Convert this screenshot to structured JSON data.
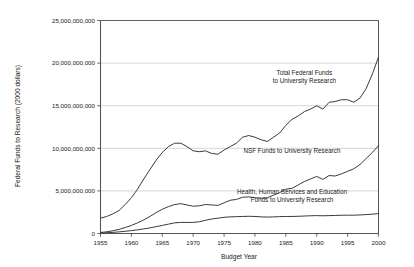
{
  "chart_data": {
    "type": "line",
    "title": "",
    "xlabel": "Budget Year",
    "ylabel": "Federal Funds to Research (2000 dollars)",
    "xlim": [
      1955,
      2000
    ],
    "ylim": [
      0,
      25000000000
    ],
    "grid": true,
    "grid_axis": "y",
    "legend_position": "inline-annotations",
    "xticks": [
      1955,
      1960,
      1965,
      1970,
      1975,
      1980,
      1985,
      1990,
      1995,
      2000
    ],
    "xtick_labels": [
      "1955",
      "1960",
      "1965",
      "1970",
      "1975",
      "1980",
      "1985",
      "1990",
      "1995",
      "2000"
    ],
    "yticks": [
      0,
      5000000000,
      10000000000,
      15000000000,
      20000000000,
      25000000000
    ],
    "ytick_labels": [
      "0",
      "5,000,000,000",
      "10,000,000,000",
      "15,000,000,000",
      "20,000,000,000",
      "25,000,000,000"
    ],
    "line_color": "#3a3a3a",
    "grid_color": "#cccccc",
    "axis_color": "#555555",
    "x": [
      1955,
      1956,
      1957,
      1958,
      1959,
      1960,
      1961,
      1962,
      1963,
      1964,
      1965,
      1966,
      1967,
      1968,
      1969,
      1970,
      1971,
      1972,
      1973,
      1974,
      1975,
      1976,
      1977,
      1978,
      1979,
      1980,
      1981,
      1982,
      1983,
      1984,
      1985,
      1986,
      1987,
      1988,
      1989,
      1990,
      1991,
      1992,
      1993,
      1994,
      1995,
      1996,
      1997,
      1998,
      1999,
      2000
    ],
    "series": [
      {
        "name": "Total Federal Funds to University Research",
        "annotation_lines": [
          "Total Federal Funds",
          "to University Research"
        ],
        "values": [
          1800000000,
          2000000000,
          2300000000,
          2700000000,
          3400000000,
          4200000000,
          5200000000,
          6400000000,
          7500000000,
          8600000000,
          9500000000,
          10200000000,
          10600000000,
          10600000000,
          10200000000,
          9700000000,
          9600000000,
          9700000000,
          9400000000,
          9300000000,
          9800000000,
          10200000000,
          10600000000,
          11300000000,
          11500000000,
          11300000000,
          11000000000,
          10800000000,
          11300000000,
          11800000000,
          12700000000,
          13400000000,
          13800000000,
          14300000000,
          14600000000,
          15000000000,
          14600000000,
          15400000000,
          15500000000,
          15700000000,
          15700000000,
          15400000000,
          15900000000,
          17000000000,
          18700000000,
          20700000000
        ]
      },
      {
        "name": "NSF Funds to University Research",
        "annotation_lines": [
          "NSF Funds to University Research"
        ],
        "values": [
          120000000,
          200000000,
          320000000,
          480000000,
          700000000,
          950000000,
          1250000000,
          1600000000,
          2000000000,
          2450000000,
          2850000000,
          3150000000,
          3400000000,
          3500000000,
          3350000000,
          3200000000,
          3250000000,
          3400000000,
          3350000000,
          3300000000,
          3600000000,
          3900000000,
          4000000000,
          4250000000,
          4300000000,
          4200000000,
          4150000000,
          4200000000,
          4500000000,
          4800000000,
          5200000000,
          5300000000,
          5700000000,
          6100000000,
          6400000000,
          6700000000,
          6350000000,
          6800000000,
          6750000000,
          7000000000,
          7300000000,
          7600000000,
          8100000000,
          8800000000,
          9500000000,
          10300000000
        ]
      },
      {
        "name": "Health, Human Services and Education Funds to University Research",
        "annotation_lines": [
          "Health, Human Services and Education",
          "Funds to University Research"
        ],
        "values": [
          60000000,
          90000000,
          130000000,
          190000000,
          260000000,
          340000000,
          430000000,
          540000000,
          660000000,
          800000000,
          950000000,
          1100000000,
          1250000000,
          1300000000,
          1300000000,
          1300000000,
          1380000000,
          1550000000,
          1700000000,
          1800000000,
          1900000000,
          1950000000,
          1980000000,
          2000000000,
          2020000000,
          2000000000,
          1950000000,
          1930000000,
          1950000000,
          1980000000,
          2000000000,
          2000000000,
          2020000000,
          2050000000,
          2080000000,
          2100000000,
          2080000000,
          2100000000,
          2120000000,
          2140000000,
          2150000000,
          2150000000,
          2180000000,
          2220000000,
          2270000000,
          2330000000
        ]
      }
    ],
    "annotations": [
      {
        "id": "total-federal-funds-annotation",
        "lines": [
          "Total Federal Funds",
          "to University Research"
        ],
        "anchor_x": 1988,
        "anchor_y": 18600000000
      },
      {
        "id": "nsf-funds-annotation",
        "lines": [
          "NSF Funds to University Research"
        ],
        "anchor_x": 1986,
        "anchor_y": 9400000000
      },
      {
        "id": "hhs-education-funds-annotation",
        "lines": [
          "Health, Human Services and Education",
          "Funds to University Research"
        ],
        "anchor_x": 1986,
        "anchor_y": 4600000000
      }
    ]
  }
}
